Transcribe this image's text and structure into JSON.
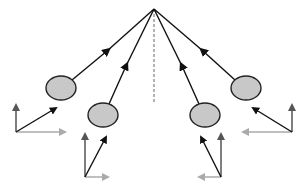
{
  "diagram": {
    "type": "ray-convergence",
    "colors": {
      "background": "#ffffff",
      "ray": "#111111",
      "ellipse_fill": "#c8c8c8",
      "ellipse_stroke": "#222222",
      "axis_dark": "#555555",
      "axis_light": "#aaaaaa",
      "center_line": "#666666"
    },
    "apex": {
      "x": 154,
      "y": 9
    },
    "center_line": {
      "x": 154,
      "y1": 9,
      "y2": 104
    },
    "objects": [
      {
        "id": "left-outer",
        "ellipse": {
          "cx": 61,
          "cy": 88,
          "rx": 15,
          "ry": 12
        },
        "ray_start": {
          "x": 72,
          "y": 80
        },
        "ray_arrow": {
          "x": 107,
          "y": 51
        },
        "frame": {
          "origin": {
            "x": 16,
            "y": 132
          },
          "vertical_tip": {
            "x": 16,
            "y": 102
          },
          "horizontal_tip": {
            "x": 68,
            "y": 132
          },
          "vector_tip": {
            "x": 56,
            "y": 108
          }
        }
      },
      {
        "id": "left-inner",
        "ellipse": {
          "cx": 103,
          "cy": 115,
          "rx": 15,
          "ry": 12
        },
        "ray_start": {
          "x": 109,
          "y": 104
        },
        "ray_arrow": {
          "x": 126,
          "y": 66
        },
        "frame": {
          "origin": {
            "x": 85,
            "y": 177
          },
          "vertical_tip": {
            "x": 85,
            "y": 131
          },
          "horizontal_tip": {
            "x": 111,
            "y": 177
          },
          "vector_tip": {
            "x": 106,
            "y": 137
          }
        }
      },
      {
        "id": "right-inner",
        "ellipse": {
          "cx": 205,
          "cy": 115,
          "rx": 15,
          "ry": 12
        },
        "ray_start": {
          "x": 199,
          "y": 104
        },
        "ray_arrow": {
          "x": 182,
          "y": 66
        },
        "frame": {
          "origin": {
            "x": 221,
            "y": 177
          },
          "vertical_tip": {
            "x": 221,
            "y": 131
          },
          "horizontal_tip": {
            "x": 196,
            "y": 177
          },
          "vector_tip": {
            "x": 201,
            "y": 137
          }
        }
      },
      {
        "id": "right-outer",
        "ellipse": {
          "cx": 246,
          "cy": 88,
          "rx": 15,
          "ry": 12
        },
        "ray_start": {
          "x": 235,
          "y": 80
        },
        "ray_arrow": {
          "x": 203,
          "y": 51
        },
        "frame": {
          "origin": {
            "x": 292,
            "y": 132
          },
          "vertical_tip": {
            "x": 292,
            "y": 102
          },
          "horizontal_tip": {
            "x": 240,
            "y": 132
          },
          "vector_tip": {
            "x": 253,
            "y": 108
          }
        }
      }
    ]
  }
}
